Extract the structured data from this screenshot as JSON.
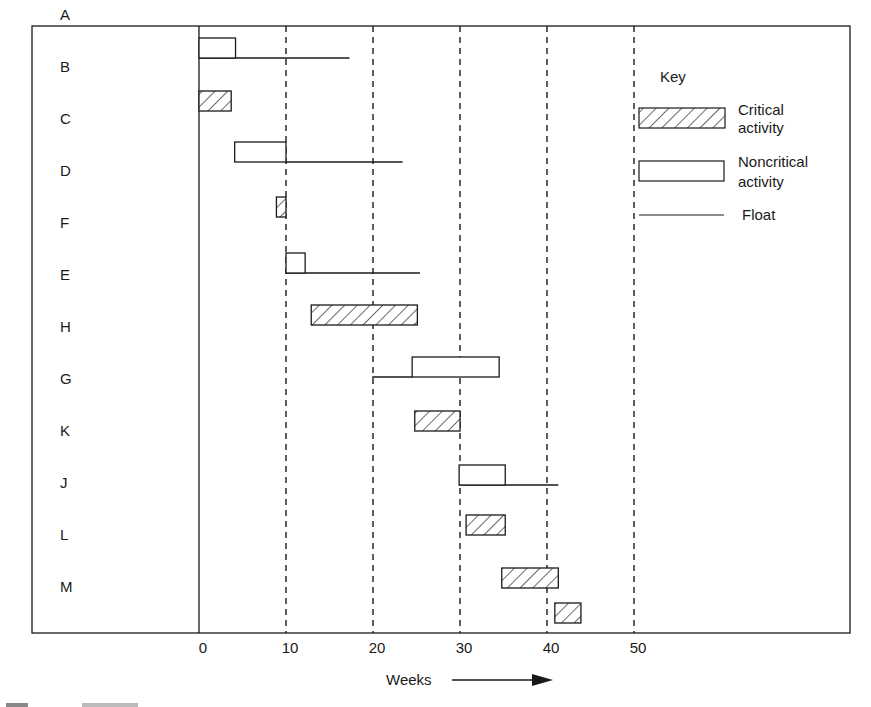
{
  "chart_data": {
    "type": "gantt",
    "title": "",
    "xlabel": "Weeks",
    "ylabel": "",
    "xlim": [
      0,
      50
    ],
    "x_ticks": [
      0,
      10,
      20,
      30,
      40,
      50
    ],
    "grid": "vertical dashed at each tick",
    "legend": {
      "title": "Key",
      "entries": [
        {
          "label_line1": "Critical",
          "label_line2": "activity",
          "style": "hatched"
        },
        {
          "label_line1": "Noncritical",
          "label_line2": "activity",
          "style": "open"
        },
        {
          "label_line1": "Float",
          "label_line2": "",
          "style": "line"
        }
      ],
      "position": "upper right"
    },
    "activities": [
      {
        "name": "A",
        "start": 0,
        "end": 4.2,
        "critical": false,
        "float_start": 0,
        "float_end": 17.3
      },
      {
        "name": "B",
        "start": 0,
        "end": 3.7,
        "critical": true
      },
      {
        "name": "C",
        "start": 4.1,
        "end": 10,
        "critical": false,
        "float_start": 10,
        "float_end": 23.4
      },
      {
        "name": "D",
        "start": 8.9,
        "end": 10,
        "critical": true
      },
      {
        "name": "F",
        "start": 10,
        "end": 12.2,
        "critical": false,
        "float_start": 10,
        "float_end": 25.4
      },
      {
        "name": "E",
        "start": 12.9,
        "end": 25.1,
        "critical": true
      },
      {
        "name": "H",
        "start": 24.5,
        "end": 34.5,
        "critical": false,
        "float_start": 19.9,
        "float_end": 24.5
      },
      {
        "name": "G",
        "start": 24.8,
        "end": 30,
        "critical": true
      },
      {
        "name": "K",
        "start": 29.9,
        "end": 35.2,
        "critical": false,
        "float_start": 29.9,
        "float_end": 41.3
      },
      {
        "name": "J",
        "start": 30.7,
        "end": 35.2,
        "critical": true
      },
      {
        "name": "L",
        "start": 34.8,
        "end": 41.3,
        "critical": true
      },
      {
        "name": "M",
        "start": 40.9,
        "end": 43.9,
        "critical": true
      }
    ]
  },
  "axis": {
    "xlabel": "Weeks",
    "ticks": [
      "0",
      "10",
      "20",
      "30",
      "40",
      "50"
    ]
  },
  "key": {
    "title": "Key",
    "critical_l1": "Critical",
    "critical_l2": "activity",
    "noncritical_l1": "Noncritical",
    "noncritical_l2": "activity",
    "float": "Float"
  }
}
